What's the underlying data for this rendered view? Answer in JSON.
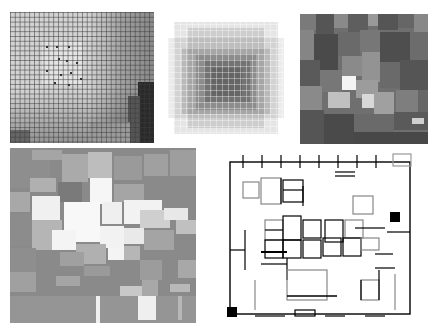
{
  "figure": {
    "panels": [
      {
        "id": "p1",
        "kind": "gridded-gradient"
      },
      {
        "id": "p2",
        "kind": "blurred-tile-blob"
      },
      {
        "id": "p3",
        "kind": "dark-tile-mosaic"
      },
      {
        "id": "p4",
        "kind": "light-tile-mosaic"
      },
      {
        "id": "p5",
        "kind": "line-floorplan"
      }
    ]
  },
  "colors": {
    "background": "#ffffff",
    "p1_base": "#d2d2d2",
    "p3_base": "#6f6f6f",
    "p4_base": "#8a8a8a",
    "line": "#000000"
  }
}
